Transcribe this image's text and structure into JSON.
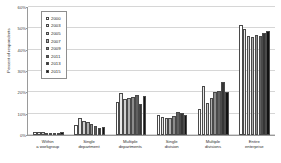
{
  "chart_data": {
    "type": "bar",
    "title": "",
    "xlabel": "",
    "ylabel": "Percent of respondents",
    "ylim": [
      0,
      60
    ],
    "ytick_labels": [
      "0%",
      "10%",
      "20%",
      "30%",
      "40%",
      "50%",
      "60%"
    ],
    "ytick_values": [
      0,
      10,
      20,
      30,
      40,
      50,
      60
    ],
    "grid": true,
    "legend_position": "upper-left-inside",
    "categories": [
      "Within a workgroup",
      "Single department",
      "Multiple departments",
      "Single division",
      "Multiple divisions",
      "Entire enterprise"
    ],
    "series": [
      {
        "name": "2000",
        "color": "#ffffff",
        "values": [
          1.6,
          4.5,
          15.5,
          9.2,
          12.0,
          51.5
        ]
      },
      {
        "name": "2003",
        "color": "#e8e8e8",
        "values": [
          1.4,
          7.8,
          19.8,
          8.3,
          23.0,
          49.5
        ]
      },
      {
        "name": "2005",
        "color": "#cfcfcf",
        "values": [
          1.2,
          6.8,
          17.0,
          8.0,
          15.0,
          46.5
        ]
      },
      {
        "name": "2007",
        "color": "#aeaeae",
        "values": [
          1.1,
          6.0,
          17.3,
          8.1,
          17.5,
          46.0
        ]
      },
      {
        "name": "2009",
        "color": "#8c8c8c",
        "values": [
          1.0,
          5.2,
          17.6,
          8.8,
          20.2,
          46.8
        ]
      },
      {
        "name": "2011",
        "color": "#606060",
        "values": [
          0.9,
          4.3,
          18.6,
          10.6,
          20.5,
          46.6
        ]
      },
      {
        "name": "2013",
        "color": "#363636",
        "values": [
          1.0,
          3.2,
          14.4,
          10.2,
          25.0,
          47.6
        ]
      },
      {
        "name": "2015",
        "color": "#121212",
        "values": [
          1.3,
          3.6,
          18.3,
          9.3,
          20.3,
          48.6
        ]
      }
    ]
  }
}
